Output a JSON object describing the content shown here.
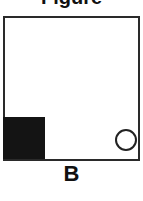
{
  "figure": {
    "title_partial": "Figure",
    "label": "B",
    "shapes": [
      {
        "type": "square",
        "fill": "#141414",
        "position": "bottom-left"
      },
      {
        "type": "circle",
        "fill": "#ffffff",
        "stroke": "#222222",
        "position": "bottom-right"
      }
    ],
    "frame_color": "#2a2a2a"
  }
}
